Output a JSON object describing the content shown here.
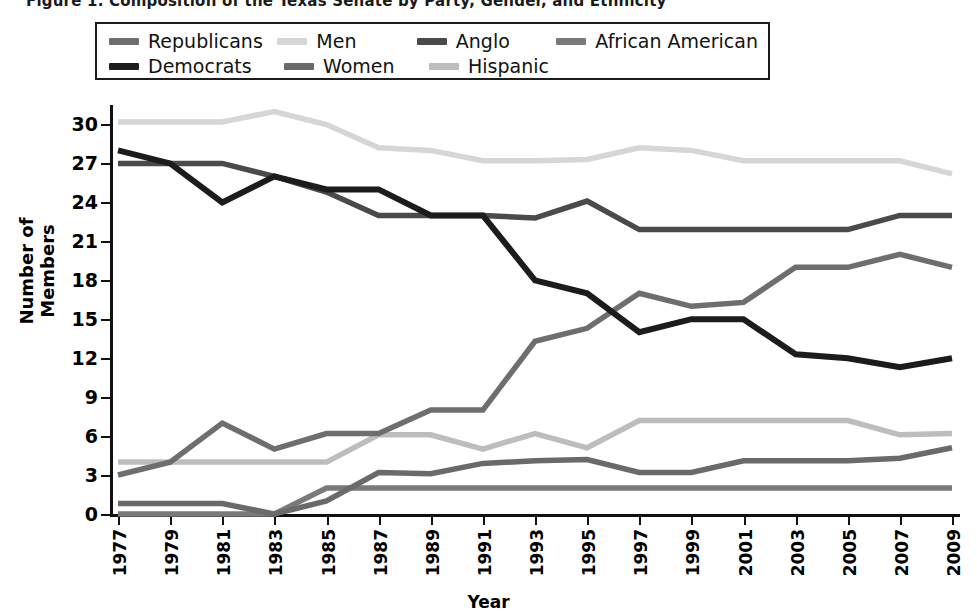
{
  "title": "Figure 1.  Composition of the Texas Senate by Party, Gender, and Ethnicity",
  "axes": {
    "ylabel": "Number of Members",
    "xlabel": "Year",
    "yticks": [
      0,
      3,
      6,
      9,
      12,
      15,
      18,
      21,
      24,
      27,
      30
    ],
    "ylim": [
      0,
      31.5
    ]
  },
  "legend": {
    "rows": [
      [
        {
          "label": "Republicans",
          "color": "#6e6e6e",
          "col": "c1"
        },
        {
          "label": "Men",
          "color": "#d6d6d6",
          "col": "c2"
        },
        {
          "label": "Anglo",
          "color": "#4a4a4a",
          "col": "c3"
        },
        {
          "label": "African American",
          "color": "#7a7a7a",
          "col": "c4"
        }
      ],
      [
        {
          "label": "Democrats",
          "color": "#1c1c1c",
          "col": "c1"
        },
        {
          "label": "Women",
          "color": "#6a6a6a",
          "col": "c2"
        },
        {
          "label": "Hispanic",
          "color": "#bdbdbd",
          "col": "c3"
        }
      ]
    ]
  },
  "chart_data": {
    "type": "line",
    "title": "Composition of the Texas Senate by Party, Gender, and Ethnicity",
    "xlabel": "Year",
    "ylabel": "Number of Members",
    "ylim": [
      0,
      31.5
    ],
    "yticks": [
      0,
      3,
      6,
      9,
      12,
      15,
      18,
      21,
      24,
      27,
      30
    ],
    "grid": false,
    "legend_position": "top",
    "x": [
      1977,
      1979,
      1981,
      1983,
      1985,
      1987,
      1989,
      1991,
      1993,
      1995,
      1997,
      1999,
      2001,
      2003,
      2005,
      2007,
      2009
    ],
    "categories": [
      "1977",
      "1979",
      "1981",
      "1983",
      "1985",
      "1987",
      "1989",
      "1991",
      "1993",
      "1995",
      "1997",
      "1999",
      "2001",
      "2003",
      "2005",
      "2007",
      "2009"
    ],
    "series": [
      {
        "name": "Democrats",
        "color": "#1c1c1c",
        "values": [
          28,
          27,
          24,
          26,
          25,
          25,
          23,
          23,
          18,
          17,
          14,
          15,
          15,
          12.3,
          12,
          11.3,
          12
        ]
      },
      {
        "name": "Republicans",
        "color": "#6e6e6e",
        "values": [
          3,
          4,
          7,
          5,
          6.2,
          6.2,
          8,
          8,
          13.3,
          14.3,
          17,
          16,
          16.3,
          19,
          19,
          20,
          19
        ]
      },
      {
        "name": "Men",
        "color": "#d6d6d6",
        "values": [
          30.2,
          30.2,
          30.2,
          31,
          30,
          28.2,
          28,
          27.2,
          27.2,
          27.3,
          28.2,
          28,
          27.2,
          27.2,
          27.2,
          27.2,
          26.2
        ]
      },
      {
        "name": "Women",
        "color": "#6a6a6a",
        "values": [
          0.8,
          0.8,
          0.8,
          0,
          1,
          3.2,
          3.1,
          3.9,
          4.1,
          4.2,
          3.2,
          3.2,
          4.1,
          4.1,
          4.1,
          4.3,
          5.1
        ]
      },
      {
        "name": "Anglo",
        "color": "#4a4a4a",
        "values": [
          27,
          27,
          27,
          26,
          24.8,
          23,
          23,
          23,
          22.8,
          24.1,
          21.9,
          21.9,
          21.9,
          21.9,
          21.9,
          23,
          23
        ]
      },
      {
        "name": "Hispanic",
        "color": "#bdbdbd",
        "values": [
          4,
          4,
          4,
          4,
          4,
          6.1,
          6.1,
          5,
          6.2,
          5.1,
          7.2,
          7.2,
          7.2,
          7.2,
          7.2,
          6.1,
          6.2
        ]
      },
      {
        "name": "African American",
        "color": "#7a7a7a",
        "values": [
          0,
          0,
          0,
          0,
          2,
          2,
          2,
          2,
          2,
          2,
          2,
          2,
          2,
          2,
          2,
          2,
          2
        ]
      }
    ]
  }
}
